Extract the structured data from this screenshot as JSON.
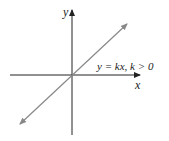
{
  "diagram": {
    "x_axis_label": "x",
    "y_axis_label": "y",
    "line_label": "y = kx, k > 0",
    "colors": {
      "axes": "#222222",
      "line": "#888888",
      "background": "#ffffff"
    }
  }
}
